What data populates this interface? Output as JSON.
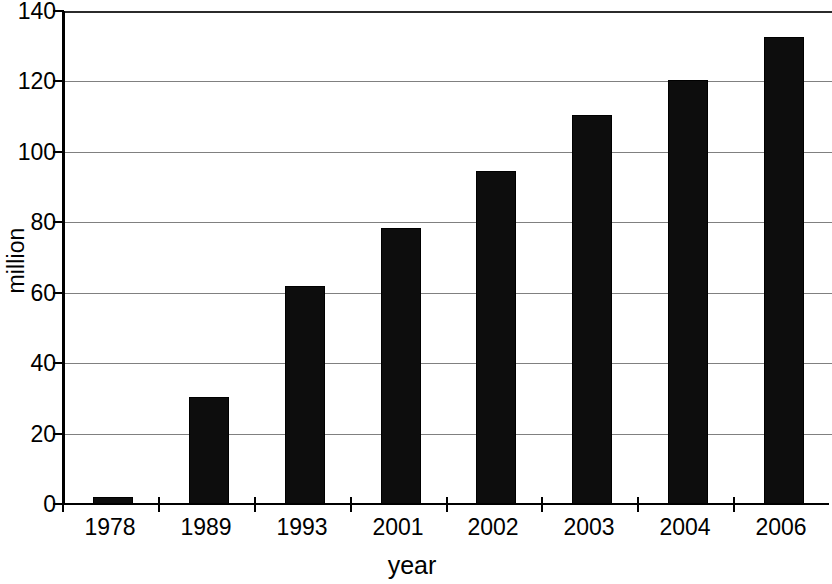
{
  "chart_data": {
    "type": "bar",
    "title": "",
    "subtitle": "",
    "xlabel": "year",
    "ylabel": "million",
    "categories": [
      "1978",
      "1989",
      "1993",
      "2001",
      "2002",
      "2003",
      "2004",
      "2006"
    ],
    "values": [
      2,
      30.3,
      62,
      78.3,
      94.6,
      110.5,
      120.5,
      132.5
    ],
    "series": [
      {
        "name": "",
        "values": [
          2,
          30.3,
          62,
          78.3,
          94.6,
          110.5,
          120.5,
          132.5
        ]
      }
    ],
    "ylim": [
      0,
      140
    ],
    "ytick_labels": [
      "0",
      "20",
      "40",
      "60",
      "80",
      "100",
      "120",
      "140"
    ],
    "ytick_values": [
      0,
      20,
      40,
      60,
      80,
      100,
      120,
      140
    ],
    "grid": "horizontal",
    "legend": "none",
    "bar_color": "#0d0d0d",
    "gridline_color": "#808080",
    "axis_color": "#000000",
    "background_color": "#ffffff"
  }
}
